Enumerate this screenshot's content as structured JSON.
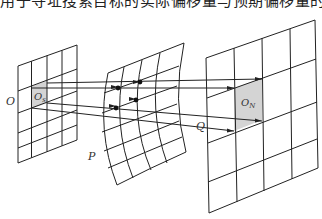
{
  "caption_fragment": "用于寻址搜索目标的实际偏移量与预期偏移量的差值作为搜索依据",
  "diagram": {
    "type": "grid-mapping-illustration",
    "planes": [
      {
        "id": "O",
        "label": "O",
        "shape": "parallelogram-grid",
        "columns": 4,
        "rows": 5,
        "highlight_cell_label": "O",
        "highlight_cell_sub": "s"
      },
      {
        "id": "P",
        "label": "P",
        "shape": "curved-warped-grid",
        "columns": 5,
        "rows": 6,
        "marked_points": 4
      },
      {
        "id": "Q",
        "label": "Q",
        "shape": "parallelogram-grid",
        "columns": 4,
        "rows": 4,
        "highlight_cell_label": "O",
        "highlight_cell_sub": "N"
      }
    ],
    "projection_rays": 4,
    "colors": {
      "line": "#222222",
      "highlight_fill": "#d4d4d4",
      "background": "#ffffff"
    }
  }
}
